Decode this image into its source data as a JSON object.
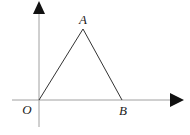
{
  "diagram": {
    "type": "coordinate-geometry",
    "colors": {
      "stroke": "#333333",
      "axis": "#999999",
      "text": "#222222"
    },
    "axes": {
      "x_axis": {
        "from": [
          12,
          100
        ],
        "to": [
          183,
          100
        ]
      },
      "y_axis": {
        "from": [
          39,
          127
        ],
        "to": [
          39,
          2
        ]
      }
    },
    "points": [
      {
        "id": "O",
        "label": "O",
        "x": 39,
        "y": 100,
        "label_x": 27,
        "label_y": 114
      },
      {
        "id": "A",
        "label": "A",
        "x": 83,
        "y": 29,
        "label_x": 83,
        "label_y": 24
      },
      {
        "id": "B",
        "label": "B",
        "x": 122,
        "y": 100,
        "label_x": 123,
        "label_y": 115
      }
    ],
    "segments": [
      {
        "from": "O",
        "to": "A"
      },
      {
        "from": "A",
        "to": "B"
      }
    ]
  }
}
